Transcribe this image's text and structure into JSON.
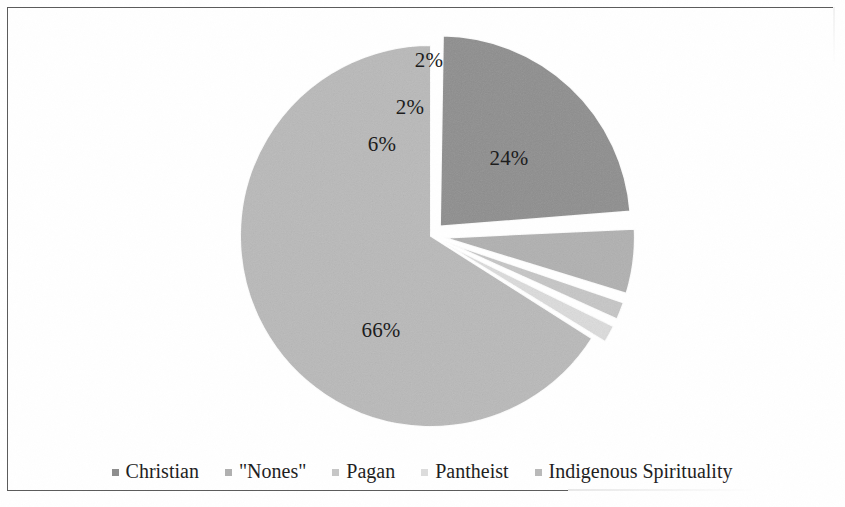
{
  "chart_data": {
    "type": "pie",
    "title": "",
    "subtitle": "",
    "xlabel": "",
    "ylabel": "",
    "grid": false,
    "legend_position": "bottom",
    "categories": [
      "Christian",
      "\"Nones\"",
      "Pagan",
      "Pantheist",
      "Indigenous Spirituality"
    ],
    "values": [
      24,
      6,
      2,
      2,
      66
    ],
    "value_labels": [
      "24%",
      "6%",
      "2%",
      "2%",
      "66%"
    ],
    "colors": [
      "#8d8d8d",
      "#b0b0b0",
      "#c6c6c6",
      "#dcdcdc",
      "#b9b9b9"
    ],
    "exploded": [
      true,
      true,
      true,
      true,
      false
    ],
    "slices": [
      {
        "name": "Christian",
        "value": 24,
        "label": "24%",
        "color": "#8d8d8d",
        "exploded": true,
        "label_x": 501,
        "label_y": 150
      },
      {
        "name": "\"Nones\"",
        "value": 6,
        "label": "6%",
        "color": "#b0b0b0",
        "exploded": true,
        "label_x": 374,
        "label_y": 136
      },
      {
        "name": "Pagan",
        "value": 2,
        "label": "2%",
        "color": "#c6c6c6",
        "exploded": true,
        "label_x": 402,
        "label_y": 99
      },
      {
        "name": "Pantheist",
        "value": 2,
        "label": "2%",
        "color": "#dcdcdc",
        "exploded": true,
        "label_x": 421,
        "label_y": 52
      },
      {
        "name": "Indigenous Spirituality",
        "value": 66,
        "label": "66%",
        "color": "#b9b9b9",
        "exploded": false,
        "label_x": 373,
        "label_y": 322
      }
    ]
  },
  "legend": {
    "items": [
      {
        "label": "Christian",
        "color": "#8d8d8d"
      },
      {
        "label": "\"Nones\"",
        "color": "#b0b0b0"
      },
      {
        "label": "Pagan",
        "color": "#c6c6c6"
      },
      {
        "label": "Pantheist",
        "color": "#dcdcdc"
      },
      {
        "label": "Indigenous Spirituality",
        "color": "#b9b9b9"
      }
    ]
  },
  "frame": {
    "border_color": "#5a5a5a",
    "background": "#ffffff"
  }
}
